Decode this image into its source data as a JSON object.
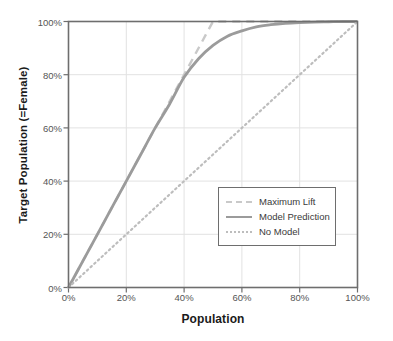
{
  "chart_data": {
    "type": "line",
    "title": "",
    "xlabel": "Population",
    "ylabel": "Target Population (=Female)",
    "xlim": [
      0,
      100
    ],
    "ylim": [
      0,
      100
    ],
    "grid": true,
    "legend_position": "center-right",
    "x_ticks": [
      "0%",
      "20%",
      "40%",
      "60%",
      "80%",
      "100%"
    ],
    "x_tick_values": [
      0,
      20,
      40,
      60,
      80,
      100
    ],
    "y_ticks": [
      "0%",
      "20%",
      "40%",
      "60%",
      "80%",
      "100%"
    ],
    "y_tick_values": [
      0,
      20,
      40,
      60,
      80,
      100
    ],
    "series": [
      {
        "name": "Maximum Lift",
        "style": "dashed",
        "color": "#c9c9c9",
        "x": [
          0,
          50,
          100
        ],
        "values": [
          0,
          100,
          100
        ]
      },
      {
        "name": "Model Prediction",
        "style": "solid",
        "color": "#9b9b9b",
        "x": [
          0,
          5,
          10,
          15,
          20,
          25,
          30,
          35,
          40,
          45,
          50,
          55,
          60,
          65,
          70,
          75,
          80,
          85,
          90,
          95,
          100
        ],
        "values": [
          0,
          10,
          20,
          30,
          40,
          50,
          60,
          69,
          79,
          86,
          91,
          94.5,
          96.5,
          98,
          98.8,
          99.3,
          99.6,
          99.8,
          99.9,
          100,
          100
        ]
      },
      {
        "name": "No Model",
        "style": "dotted",
        "color": "#bdbdbd",
        "x": [
          0,
          100
        ],
        "values": [
          0,
          100
        ]
      }
    ]
  },
  "legend": {
    "items": [
      {
        "label": "Maximum Lift"
      },
      {
        "label": "Model Prediction"
      },
      {
        "label": "No Model"
      }
    ]
  },
  "colors": {
    "axis": "#6e6e6e",
    "grid": "#e2e2e2",
    "tick_text": "#555555",
    "title_text": "#1a1a1a",
    "background": "#ffffff"
  }
}
